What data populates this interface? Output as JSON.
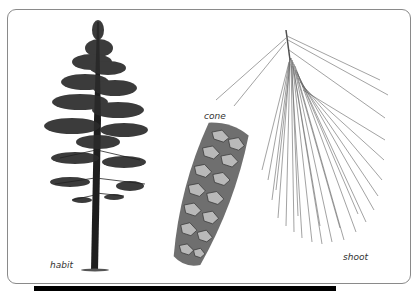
{
  "figure": {
    "panels": [
      {
        "id": "habit",
        "label": "habit"
      },
      {
        "id": "cone",
        "label": "cone"
      },
      {
        "id": "shoot",
        "label": "shoot"
      }
    ]
  },
  "colors": {
    "frame_border": "#8a8a8a",
    "ink": "#2a2a2a",
    "bottom_bar": "#000000"
  }
}
